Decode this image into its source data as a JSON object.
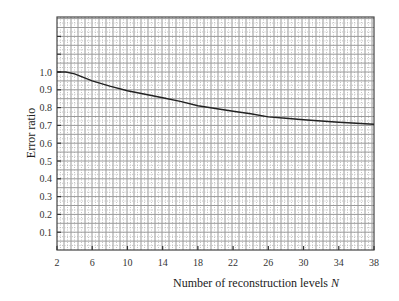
{
  "chart_data": {
    "type": "line",
    "title": "",
    "xlabel": "Number of reconstruction levels N",
    "xlabel_main": "Number of reconstruction levels ",
    "xlabel_var": "N",
    "ylabel": "Error ratio",
    "xlim": [
      2,
      38
    ],
    "ylim": [
      0,
      1.3
    ],
    "grid": true,
    "legend": null,
    "x_ticks": [
      2,
      6,
      10,
      14,
      18,
      22,
      26,
      30,
      34,
      38
    ],
    "y_ticks": [
      0.1,
      0.2,
      0.3,
      0.4,
      0.5,
      0.6,
      0.7,
      0.8,
      0.9,
      1.0
    ],
    "x_tick_labels": [
      "2",
      "6",
      "10",
      "14",
      "18",
      "22",
      "26",
      "30",
      "34",
      "38"
    ],
    "y_tick_labels": [
      "0.1",
      "0.2",
      "0.3",
      "0.4",
      "0.5",
      "0.6",
      "0.7",
      "0.8",
      "0.9",
      "1.0"
    ],
    "series": [
      {
        "name": "Error ratio",
        "x": [
          2,
          3,
          4,
          5,
          6,
          8,
          10,
          12,
          14,
          16,
          18,
          20,
          22,
          24,
          26,
          28,
          30,
          32,
          34,
          36,
          38
        ],
        "values": [
          1.0,
          1.0,
          0.99,
          0.97,
          0.95,
          0.92,
          0.895,
          0.875,
          0.855,
          0.835,
          0.81,
          0.795,
          0.78,
          0.765,
          0.748,
          0.74,
          0.732,
          0.725,
          0.718,
          0.712,
          0.706
        ]
      }
    ]
  }
}
